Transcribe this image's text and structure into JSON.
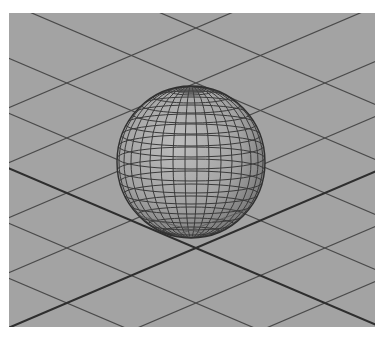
{
  "viewport": {
    "name": "perspective-viewport",
    "background_color": "#a3a3a3",
    "grid_line_color": "#4a4a4a",
    "axis_line_color": "#2e2e2e"
  },
  "scene": {
    "object": "polygon-sphere",
    "display_mode": "wireframe-on-shaded",
    "sphere": {
      "cx": 182,
      "cy": 149,
      "rx": 74,
      "ry": 76
    },
    "sphere_fill_light": "#b4b4b4",
    "sphere_fill_dark": "#7c7c7c",
    "wire_color": "#3a3a3a"
  },
  "top_caption": {
    "text": ""
  }
}
